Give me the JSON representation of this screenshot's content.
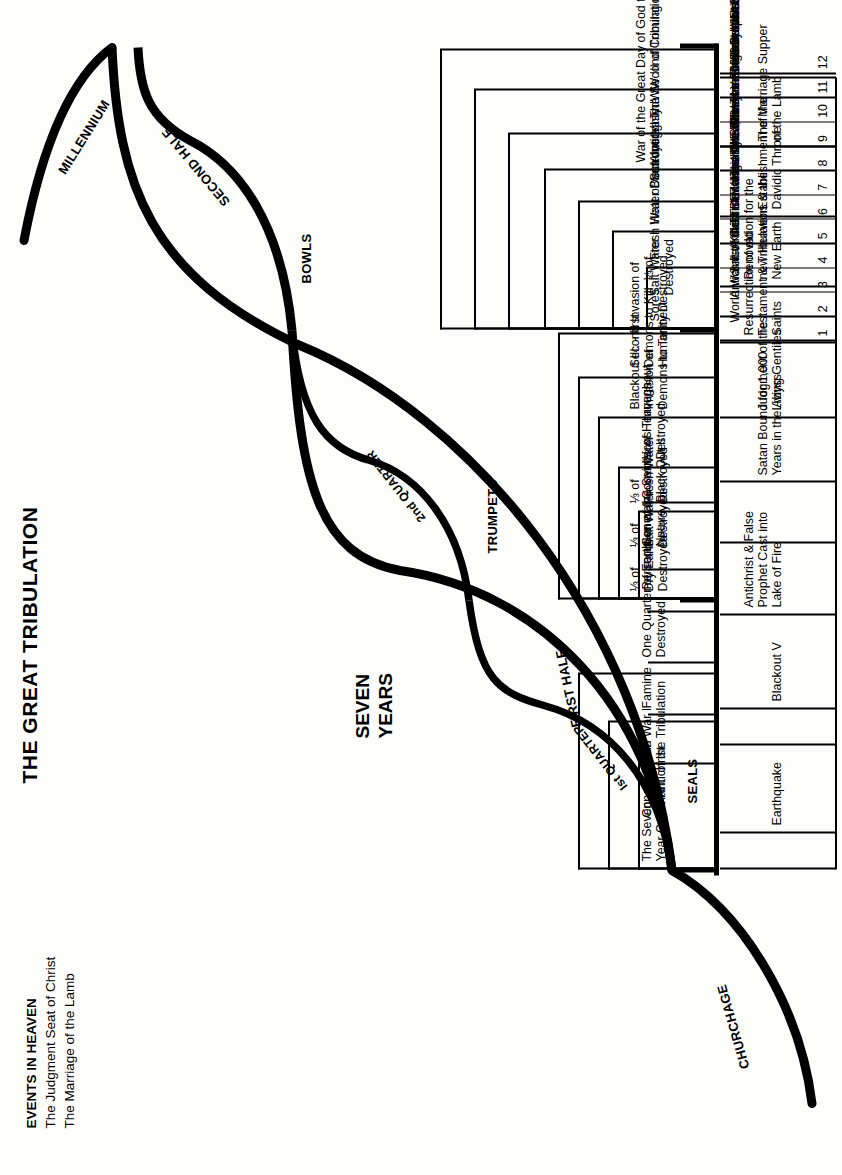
{
  "title": "THE GREAT TRIBULATION",
  "heaven": {
    "heading": "EVENTS IN HEAVEN",
    "lines": [
      "The Judgment Seat of Christ",
      "The Marriage of the Lamb"
    ]
  },
  "center_label": [
    "SEVEN",
    "YEARS"
  ],
  "arcs": {
    "millennium": "MILLENNIUM",
    "second_half": "SECOND HALF",
    "first_half": "FIRST HALF",
    "first_quarter": "Ist QUARTER",
    "second_quarter": "2nd QUARTER",
    "churchage": "CHURCHAGE"
  },
  "sections": {
    "seals": "SEALS",
    "trumpets": "TRUMPETS",
    "bowls": "BOWLS"
  },
  "seals_items": [
    "The Seven\nYear Covenant",
    "Conquests of\nthe Antichrist",
    "World War I\nof the Tribulation",
    "Famine",
    "One Quarter of Earth\nDestroyed",
    "Persecution of the Saints",
    "General Convulsions Throughout\nNature. Black Out II"
  ],
  "trumpets_items": [
    "⅓ of\nDry Earth\nDestroyed",
    "⅓ of\nSalt Water\nDestroyed",
    "⅓ of\nFresh Water\nDestroyed",
    "⅓ of Heavens\nDestroyed",
    "Blackout III. - first\nInvasion of\nDemons to Torment",
    "Second Invasion of\nDemons to Kill. ⅓ of\nHumanity Destroyed"
  ],
  "bowls_items": [
    "Sores",
    "Salt Water\nDestroyed",
    "Fresh Water Destroyed",
    "Heat of Sun Increased",
    "Blackout IV",
    "War of the Great Day of God the\nAlmigghty: WW III of Tribulation",
    "The Second Coming of Christ"
  ],
  "millennium_items": [
    "Earthquake",
    "Blackout V",
    "Antichrist & False\nProphet Cast into\nLake of Fire",
    "Satan Bound for 1,000\nYears in the Abyss",
    "Judgment of the\nLiving Gentiles",
    "Resurrection of old\nTestament & Tribulation\nSaints",
    "Renovation for the\nnew Heavens & the\nNew Earth",
    "Establishment of the\nDavidic Throne",
    "The Marriage Supper\nof the Lamb"
  ],
  "numbered_items": [
    {
      "n": "1",
      "text": "World War II of the Tribulation"
    },
    {
      "n": "2",
      "text": "Antichrist Killed"
    },
    {
      "n": "3",
      "text": "Satan Cast Down to the Earth"
    },
    {
      "n": "4",
      "text": "Antichrist Raised by Satan"
    },
    {
      "n": "5",
      "text": "Three Kings Killed, Seven Kings Submit"
    },
    {
      "n": "6",
      "text": "Ecclesiastical Babylon Destroyed"
    },
    {
      "n": "7",
      "text": "The two Witnesses killed"
    },
    {
      "n": "8",
      "text": "The Seven Year Covenant Broken"
    },
    {
      "n": "9",
      "text": "The Abomination of Desolation"
    },
    {
      "n": "10",
      "text": "The False Prophet"
    },
    {
      "n": "11",
      "text": "666 and Worship of the Antichrist"
    },
    {
      "n": "12",
      "text": "Persecution of the Jews Begins"
    }
  ],
  "systems_items": [
    "Governmental System: Ten Kings",
    "144,000 and World Wide Revival",
    "Ministry of the Two Witnesses",
    "Ministry of Elijah",
    "Religious System: Ecclesiastical Babylon"
  ],
  "colors": {
    "ink": "#000000",
    "paper": "#fdfdfb"
  }
}
